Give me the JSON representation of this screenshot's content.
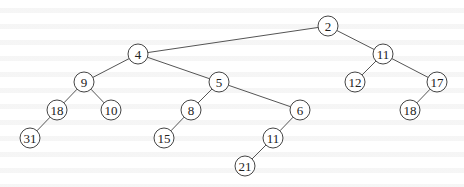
{
  "diagram": {
    "type": "binary-tree",
    "node_radius": 10,
    "colors": {
      "background": "#ffffff",
      "edge": "#555555",
      "node_stroke": "#444444",
      "node_fill": "#ffffff",
      "label": "#222222"
    },
    "nodes": [
      {
        "id": "n2",
        "label": "2",
        "x": 328,
        "y": 26
      },
      {
        "id": "n4",
        "label": "4",
        "x": 138,
        "y": 54
      },
      {
        "id": "n11a",
        "label": "11",
        "x": 383,
        "y": 54
      },
      {
        "id": "n9",
        "label": "9",
        "x": 84,
        "y": 82
      },
      {
        "id": "n5",
        "label": "5",
        "x": 219,
        "y": 82
      },
      {
        "id": "n12",
        "label": "12",
        "x": 355,
        "y": 82
      },
      {
        "id": "n17",
        "label": "17",
        "x": 437,
        "y": 82
      },
      {
        "id": "n18a",
        "label": "18",
        "x": 57,
        "y": 110
      },
      {
        "id": "n10",
        "label": "10",
        "x": 111,
        "y": 110
      },
      {
        "id": "n8",
        "label": "8",
        "x": 191,
        "y": 110
      },
      {
        "id": "n6",
        "label": "6",
        "x": 300,
        "y": 110
      },
      {
        "id": "n18b",
        "label": "18",
        "x": 410,
        "y": 110
      },
      {
        "id": "n31",
        "label": "31",
        "x": 30,
        "y": 138
      },
      {
        "id": "n15",
        "label": "15",
        "x": 164,
        "y": 138
      },
      {
        "id": "n11b",
        "label": "11",
        "x": 273,
        "y": 138
      },
      {
        "id": "n21",
        "label": "21",
        "x": 245,
        "y": 166
      }
    ],
    "edges": [
      {
        "from": "n2",
        "to": "n4"
      },
      {
        "from": "n2",
        "to": "n11a"
      },
      {
        "from": "n4",
        "to": "n9"
      },
      {
        "from": "n4",
        "to": "n5"
      },
      {
        "from": "n11a",
        "to": "n12"
      },
      {
        "from": "n11a",
        "to": "n17"
      },
      {
        "from": "n9",
        "to": "n18a"
      },
      {
        "from": "n9",
        "to": "n10"
      },
      {
        "from": "n5",
        "to": "n8"
      },
      {
        "from": "n5",
        "to": "n6"
      },
      {
        "from": "n17",
        "to": "n18b"
      },
      {
        "from": "n18a",
        "to": "n31"
      },
      {
        "from": "n8",
        "to": "n15"
      },
      {
        "from": "n6",
        "to": "n11b"
      },
      {
        "from": "n11b",
        "to": "n21"
      }
    ]
  }
}
